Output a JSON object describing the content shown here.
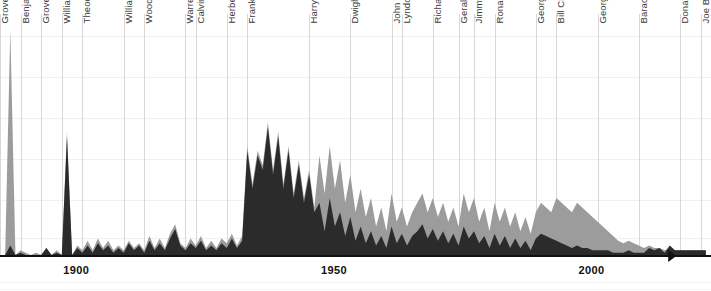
{
  "chart_data": {
    "type": "area",
    "title": "",
    "subtitle": "",
    "xlabel": "",
    "ylabel": "",
    "note": "(through October 2022)",
    "xlim": [
      1885,
      2023
    ],
    "ylim": [
      0,
      100
    ],
    "grid": true,
    "legend_position": "none",
    "x_tick_labels": [
      "1900",
      "1950",
      "2000"
    ],
    "x_tick_values": [
      1900,
      1950,
      2000
    ],
    "presidents": [
      {
        "label": "Grover Cleveland",
        "start": 1885,
        "end": 1889
      },
      {
        "label": "Benjamin Harrison",
        "start": 1889,
        "end": 1893
      },
      {
        "label": "Grover Cleveland",
        "start": 1893,
        "end": 1897
      },
      {
        "label": "William McKinley",
        "start": 1897,
        "end": 1901
      },
      {
        "label": "Theodore Roosevelt",
        "start": 1901,
        "end": 1909
      },
      {
        "label": "William Howard Taft",
        "start": 1909,
        "end": 1913
      },
      {
        "label": "Woodrow Wilson",
        "start": 1913,
        "end": 1921
      },
      {
        "label": "Warren G. Harding",
        "start": 1921,
        "end": 1923
      },
      {
        "label": "Calvin Coolidge",
        "start": 1923,
        "end": 1929
      },
      {
        "label": "Herbert Hoover",
        "start": 1929,
        "end": 1933
      },
      {
        "label": "Franklin D. Roosevelt",
        "start": 1933,
        "end": 1945
      },
      {
        "label": "Harry S Truman",
        "start": 1945,
        "end": 1953
      },
      {
        "label": "Dwight D. Eisenhower",
        "start": 1953,
        "end": 1961
      },
      {
        "label": "John F. Kennedy",
        "start": 1961,
        "end": 1963
      },
      {
        "label": "Lyndon B. Johnson",
        "start": 1963,
        "end": 1969
      },
      {
        "label": "Richard Nixon",
        "start": 1969,
        "end": 1974
      },
      {
        "label": "Gerald Ford",
        "start": 1974,
        "end": 1977
      },
      {
        "label": "Jimmy Carter",
        "start": 1977,
        "end": 1981
      },
      {
        "label": "Ronald Reagan",
        "start": 1981,
        "end": 1989
      },
      {
        "label": "George H. W. Bush",
        "start": 1989,
        "end": 1993
      },
      {
        "label": "Bill Clinton",
        "start": 1993,
        "end": 2001
      },
      {
        "label": "George W. Bush",
        "start": 2001,
        "end": 2009
      },
      {
        "label": "Barack Obama",
        "start": 2009,
        "end": 2017
      },
      {
        "label": "Donald Trump",
        "start": 2017,
        "end": 2021
      },
      {
        "label": "Joe Biden",
        "start": 2021,
        "end": 2023
      }
    ],
    "colors": {
      "series_back": "#9c9c9c",
      "series_front": "#2b2b2b",
      "axis": "#111111",
      "divider": "#d8d8d8",
      "gridline": "#f0f0f0",
      "label_text": "#3a3a3a"
    },
    "series": [
      {
        "name": "back",
        "color": "#9c9c9c",
        "x": [
          1885,
          1886,
          1887,
          1888,
          1889,
          1890,
          1891,
          1892,
          1893,
          1894,
          1895,
          1896,
          1897,
          1898,
          1899,
          1900,
          1901,
          1902,
          1903,
          1904,
          1905,
          1906,
          1907,
          1908,
          1909,
          1910,
          1911,
          1912,
          1913,
          1914,
          1915,
          1916,
          1917,
          1918,
          1919,
          1920,
          1921,
          1922,
          1923,
          1924,
          1925,
          1926,
          1927,
          1928,
          1929,
          1930,
          1931,
          1932,
          1933,
          1934,
          1935,
          1936,
          1937,
          1938,
          1939,
          1940,
          1941,
          1942,
          1943,
          1944,
          1945,
          1946,
          1947,
          1948,
          1949,
          1950,
          1951,
          1952,
          1953,
          1954,
          1955,
          1956,
          1957,
          1958,
          1959,
          1960,
          1961,
          1962,
          1963,
          1964,
          1965,
          1966,
          1967,
          1968,
          1969,
          1970,
          1971,
          1972,
          1973,
          1974,
          1975,
          1976,
          1977,
          1978,
          1979,
          1980,
          1981,
          1982,
          1983,
          1984,
          1985,
          1986,
          1987,
          1988,
          1989,
          1990,
          1991,
          1992,
          1993,
          1994,
          1995,
          1996,
          1997,
          1998,
          1999,
          2000,
          2001,
          2002,
          2003,
          2004,
          2005,
          2006,
          2007,
          2008,
          2009,
          2010,
          2011,
          2012,
          2013,
          2014,
          2015,
          2016,
          2017,
          2018,
          2019,
          2020,
          2021,
          2022
        ],
        "values": [
          0,
          0,
          95,
          0,
          2,
          1,
          0,
          1,
          0,
          3,
          0,
          2,
          0,
          52,
          0,
          4,
          2,
          6,
          2,
          7,
          3,
          6,
          2,
          4,
          2,
          6,
          3,
          5,
          2,
          8,
          3,
          7,
          3,
          9,
          13,
          5,
          3,
          7,
          4,
          8,
          3,
          6,
          3,
          7,
          5,
          9,
          4,
          8,
          46,
          30,
          44,
          38,
          56,
          36,
          52,
          30,
          46,
          26,
          40,
          24,
          36,
          20,
          42,
          26,
          46,
          28,
          40,
          22,
          34,
          18,
          28,
          16,
          24,
          12,
          20,
          10,
          26,
          14,
          20,
          12,
          18,
          22,
          26,
          18,
          24,
          16,
          22,
          14,
          20,
          12,
          26,
          18,
          24,
          14,
          20,
          10,
          22,
          14,
          20,
          12,
          18,
          10,
          16,
          9,
          18,
          22,
          20,
          18,
          24,
          22,
          20,
          18,
          22,
          20,
          18,
          16,
          14,
          12,
          10,
          8,
          6,
          5,
          6,
          5,
          4,
          3,
          4,
          3,
          3,
          2,
          3,
          2,
          2,
          2,
          2,
          2,
          2,
          2
        ]
      },
      {
        "name": "front",
        "color": "#2b2b2b",
        "x": [
          1885,
          1886,
          1887,
          1888,
          1889,
          1890,
          1891,
          1892,
          1893,
          1894,
          1895,
          1896,
          1897,
          1898,
          1899,
          1900,
          1901,
          1902,
          1903,
          1904,
          1905,
          1906,
          1907,
          1908,
          1909,
          1910,
          1911,
          1912,
          1913,
          1914,
          1915,
          1916,
          1917,
          1918,
          1919,
          1920,
          1921,
          1922,
          1923,
          1924,
          1925,
          1926,
          1927,
          1928,
          1929,
          1930,
          1931,
          1932,
          1933,
          1934,
          1935,
          1936,
          1937,
          1938,
          1939,
          1940,
          1941,
          1942,
          1943,
          1944,
          1945,
          1946,
          1947,
          1948,
          1949,
          1950,
          1951,
          1952,
          1953,
          1954,
          1955,
          1956,
          1957,
          1958,
          1959,
          1960,
          1961,
          1962,
          1963,
          1964,
          1965,
          1966,
          1967,
          1968,
          1969,
          1970,
          1971,
          1972,
          1973,
          1974,
          1975,
          1976,
          1977,
          1978,
          1979,
          1980,
          1981,
          1982,
          1983,
          1984,
          1985,
          1986,
          1987,
          1988,
          1989,
          1990,
          1991,
          1992,
          1993,
          1994,
          1995,
          1996,
          1997,
          1998,
          1999,
          2000,
          2001,
          2002,
          2003,
          2004,
          2005,
          2006,
          2007,
          2008,
          2009,
          2010,
          2011,
          2012,
          2013,
          2014,
          2015,
          2016,
          2017,
          2018,
          2019,
          2020,
          2021,
          2022
        ],
        "values": [
          0,
          0,
          4,
          0,
          1,
          0,
          0,
          0,
          0,
          3,
          0,
          1,
          0,
          50,
          0,
          3,
          1,
          4,
          1,
          5,
          2,
          4,
          1,
          3,
          1,
          5,
          2,
          4,
          1,
          6,
          2,
          5,
          2,
          7,
          11,
          4,
          2,
          5,
          3,
          6,
          2,
          4,
          2,
          5,
          3,
          7,
          3,
          6,
          44,
          28,
          42,
          36,
          54,
          34,
          50,
          28,
          44,
          24,
          38,
          22,
          34,
          18,
          22,
          10,
          24,
          12,
          18,
          8,
          16,
          6,
          12,
          5,
          10,
          4,
          8,
          3,
          12,
          5,
          9,
          4,
          8,
          10,
          13,
          7,
          11,
          6,
          10,
          5,
          9,
          4,
          12,
          7,
          10,
          5,
          8,
          3,
          9,
          4,
          8,
          3,
          7,
          3,
          6,
          2,
          7,
          9,
          8,
          7,
          6,
          5,
          4,
          3,
          4,
          3,
          3,
          2,
          2,
          2,
          2,
          1,
          1,
          1,
          2,
          1,
          1,
          1,
          3,
          2,
          3,
          1,
          4,
          2,
          2,
          2,
          2,
          2,
          2,
          2
        ]
      }
    ]
  }
}
